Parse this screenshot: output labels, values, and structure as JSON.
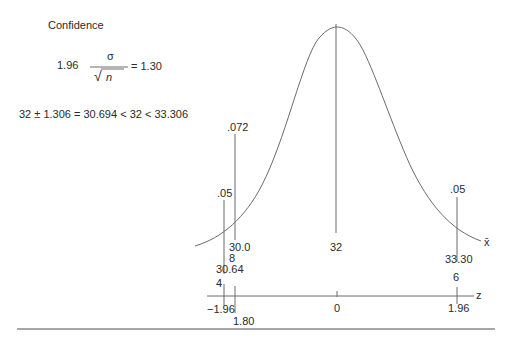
{
  "title": "Confidence",
  "formula1": {
    "coef": "1.96",
    "numerator": "σ",
    "sqrt_symbol": "√",
    "denominator": "n",
    "result": "= 1.30"
  },
  "formula2": "32 ± 1.306 = 30.694 < 32 < 33.306",
  "curve_labels": {
    "left_line_a_top": ".05",
    "left_line_b_top": ".072",
    "right_line_top": ".05",
    "left_line_b_bottom_1": "30.0",
    "left_line_b_bottom_2": "8",
    "left_line_a_bottom_1": "30.64",
    "left_line_a_bottom_2": "4",
    "center_bottom": "32",
    "right_bottom": "33.30",
    "right_bottom_2": "6",
    "xbar_axis": "x̄"
  },
  "z_axis": {
    "label": "z",
    "ticks": [
      "−1.96",
      "1.80",
      "0",
      "1.96"
    ]
  },
  "colors": {
    "line": "#6b6b6b",
    "text": "#2a2a2a",
    "rule": "#8a8a8a"
  }
}
